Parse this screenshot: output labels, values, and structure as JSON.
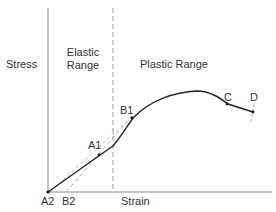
{
  "diagram": {
    "type": "stress-strain curve",
    "axes": {
      "y_label": "Stress",
      "x_label": "Strain"
    },
    "regions": {
      "elastic_line1": "Elastic",
      "elastic_line2": "Range",
      "plastic": "Plastic Range"
    },
    "points": {
      "A1": "A1",
      "A2": "A2",
      "B1": "B1",
      "B2": "B2",
      "C": "C",
      "D": "D"
    },
    "colors": {
      "axis": "#888888",
      "curve": "#222222",
      "dashed": "#999999"
    }
  }
}
